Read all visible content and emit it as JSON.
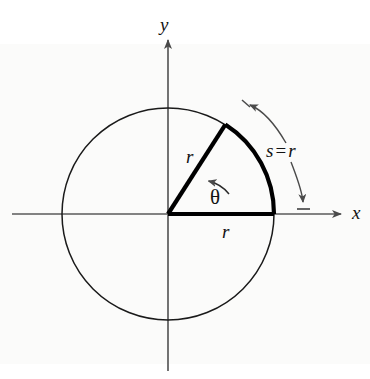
{
  "figure": {
    "kind": "geometry-diagram",
    "background_color": "#ffffff",
    "ink_color": "#121212",
    "axis_color": "#5a5a5a",
    "circle_color": "#1a1a1a",
    "sector_color": "#000000",
    "arrow_color": "#4a4a4a"
  },
  "labels": {
    "y_axis": "y",
    "x_axis": "x",
    "radius_upper": "r",
    "radius_lower": "r",
    "angle": "θ",
    "arc_s": "s",
    "arc_equals": "=",
    "arc_r": "r"
  },
  "geometry": {
    "center_x": 168,
    "center_y": 214,
    "radius": 106,
    "angle_degrees": 57.3,
    "arc_start_degrees": 0,
    "arc_end_degrees": 57.3,
    "x_axis_start": 12,
    "x_axis_end": 347,
    "y_axis_top": 32,
    "y_axis_bottom": 371
  }
}
